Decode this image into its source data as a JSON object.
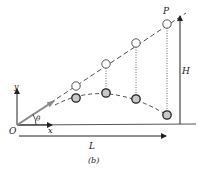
{
  "figure": {
    "caption": "(b)",
    "labels": {
      "origin": "O",
      "x_axis": "x",
      "y_axis": "y",
      "angle": "θ",
      "target": "P",
      "height": "H",
      "length": "L"
    },
    "colors": {
      "line": "#222222",
      "velocity_arrow": "#8a8a8a",
      "upper_ball_fill": "#ffffff",
      "lower_ball_fill": "#c8c8c8",
      "axis_line": "#555555"
    },
    "upper_balls": [
      {
        "x": 76,
        "y": 86
      },
      {
        "x": 106,
        "y": 64
      },
      {
        "x": 136,
        "y": 43
      },
      {
        "x": 167,
        "y": 24
      }
    ],
    "lower_balls": [
      {
        "x": 76,
        "y": 98
      },
      {
        "x": 106,
        "y": 93
      },
      {
        "x": 136,
        "y": 99
      },
      {
        "x": 167,
        "y": 115
      }
    ]
  }
}
